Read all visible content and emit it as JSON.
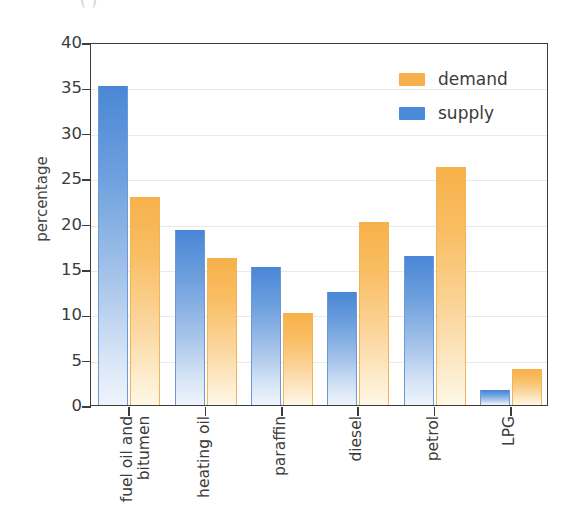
{
  "figure": {
    "top_caption_fragment": "                    (           )"
  },
  "chart_data": {
    "type": "bar",
    "title": "",
    "xlabel": "",
    "ylabel": "percentage",
    "ylim": [
      0,
      40
    ],
    "ytick_step": 5,
    "yticks": [
      "40",
      "35",
      "30",
      "25",
      "20",
      "15",
      "10",
      "5",
      "0"
    ],
    "grid": true,
    "legend_position": "top-right",
    "categories": [
      "fuel oil and\nbitumen",
      "heating oil",
      "paraffin",
      "diesel",
      "petrol",
      "LPG"
    ],
    "series": [
      {
        "name": "demand",
        "color": "#f6b04c",
        "values": [
          22.9,
          16.2,
          10.1,
          20.2,
          26.2,
          4.0
        ]
      },
      {
        "name": "supply",
        "color": "#4b8ad8",
        "values": [
          35.2,
          19.3,
          15.2,
          12.4,
          16.4,
          1.7
        ]
      }
    ]
  },
  "legend": {
    "entries": [
      {
        "label": "demand",
        "color": "#f6b04c"
      },
      {
        "label": "supply",
        "color": "#4b8ad8"
      }
    ]
  }
}
